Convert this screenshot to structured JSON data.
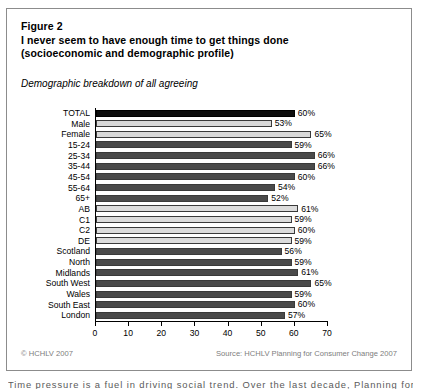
{
  "figure": {
    "title_lines": [
      "Figure 2",
      "I never seem to have enough time to get things done",
      "(socioeconomic and demographic profile)"
    ],
    "subtitle": "Demographic breakdown of all agreeing",
    "copyright": "© HCHLV 2007",
    "source": "Source: HCHLV Planning for Consumer Change 2007",
    "page_body_line": "Time pressure is a fuel in driving social trend. Over the last decade, Planning for"
  },
  "chart_data": {
    "type": "bar",
    "orientation": "horizontal",
    "title": "I never seem to have enough time to get things done (socioeconomic and demographic profile)",
    "subtitle": "Demographic breakdown of all agreeing",
    "xlabel": "",
    "ylabel": "",
    "xlim": [
      0,
      70
    ],
    "xticks": [
      0,
      10,
      20,
      30,
      40,
      50,
      60,
      70
    ],
    "xtick_labels": [
      "0",
      "10",
      "20",
      "30",
      "40",
      "50",
      "60",
      "70"
    ],
    "grid": false,
    "legend": "none",
    "value_suffix": "%",
    "categories": [
      "TOTAL",
      "Male",
      "Female",
      "15-24",
      "25-34",
      "35-44",
      "45-54",
      "55-64",
      "65+",
      "AB",
      "C1",
      "C2",
      "DE",
      "Scotland",
      "North",
      "Midlands",
      "South West",
      "Wales",
      "South East",
      "London"
    ],
    "values": [
      60,
      53,
      65,
      59,
      66,
      66,
      60,
      54,
      52,
      61,
      59,
      60,
      59,
      56,
      59,
      61,
      65,
      59,
      60,
      57
    ],
    "value_labels": [
      "60%",
      "53%",
      "65%",
      "59%",
      "66%",
      "66%",
      "60%",
      "54%",
      "52%",
      "61%",
      "59%",
      "60%",
      "59%",
      "56%",
      "59%",
      "61%",
      "65%",
      "59%",
      "60%",
      "57%"
    ],
    "bar_groups": [
      "total",
      "gender",
      "gender",
      "age",
      "age",
      "age",
      "age",
      "age",
      "age",
      "social",
      "social",
      "social",
      "social",
      "region",
      "region",
      "region",
      "region",
      "region",
      "region",
      "region"
    ],
    "group_colors": {
      "total": "#0d0d0d",
      "gender": "#d9d9d9",
      "age": "#4a4a4a",
      "social": "#dcdcdc",
      "region": "#4a4a4a"
    }
  }
}
